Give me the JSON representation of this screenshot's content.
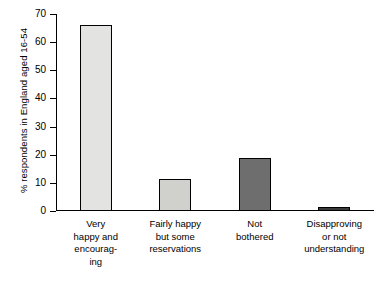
{
  "chart_data": {
    "type": "bar",
    "title": "",
    "subtitle": "",
    "xlabel": "",
    "ylabel": "% respondents in England aged 16-54",
    "ylim": [
      0,
      70
    ],
    "ytick_step": 10,
    "yticks": [
      "0",
      "10",
      "20",
      "30",
      "40",
      "50",
      "60",
      "70"
    ],
    "grid": false,
    "legend": "none",
    "categories": [
      "Very\nhappy and\nencourag-\ning",
      "Fairly happy\nbut some\nreservations",
      "Not\nbothered",
      "Disapproving\nor not\nunderstanding"
    ],
    "category_lines": [
      [
        "Very",
        "happy and",
        "encourag-",
        "ing"
      ],
      [
        "Fairly happy",
        "but some",
        "reservations"
      ],
      [
        "Not",
        "bothered"
      ],
      [
        "Disapproving",
        "or not",
        "understanding"
      ]
    ],
    "values": [
      66,
      11.5,
      19,
      1.5
    ],
    "bar_colors": [
      "#e3e3e1",
      "#d0d0cd",
      "#6e6e6e",
      "#3a3a3a"
    ],
    "bar_border_color": "#000000",
    "axis_color": "#000000",
    "background_color": "#ffffff"
  }
}
